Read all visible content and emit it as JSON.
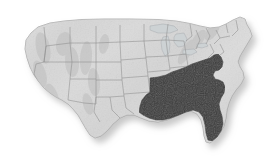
{
  "figure": {
    "kind": "thematic-choropleth-map",
    "caption": "",
    "background_color": "#ffffff",
    "width": 274,
    "height": 168
  },
  "map": {
    "region_name": "Contiguous United States",
    "projection_style": "shaded-relief",
    "shows_state_boundaries": true,
    "shows_drop_shadow": true,
    "base_fill_color": "#dadada",
    "base_shade_light": "#e8e8e8",
    "base_shade_dark": "#bdbdbd",
    "boundary_color": "#8d8d8d",
    "outline_color": "#9a9a9a",
    "highlight_fill_color": "#3a3a3a",
    "highlight_boundary_color": "#2c2c2c",
    "shadow_color": "#cfcfcf"
  },
  "legend": {
    "visible": false,
    "entries": [
      {
        "label": "Highlighted region",
        "color": "#3a3a3a"
      },
      {
        "label": "Other states",
        "color": "#dadada"
      }
    ]
  },
  "highlighted_region": {
    "name": "Southeast",
    "fill_color": "#3a3a3a",
    "states": [
      "Virginia",
      "Kentucky",
      "Tennessee",
      "North Carolina",
      "South Carolina",
      "Georgia",
      "Florida",
      "Alabama",
      "Mississippi",
      "Louisiana",
      "Arkansas"
    ],
    "state_count": 11
  },
  "unhighlighted_regions": {
    "name": "Remainder of the contiguous United States",
    "fill_color": "#dadada",
    "example_states": [
      "Washington",
      "Oregon",
      "California",
      "Idaho",
      "Nevada",
      "Montana",
      "Wyoming",
      "Utah",
      "Arizona",
      "Colorado",
      "New Mexico",
      "North Dakota",
      "South Dakota",
      "Nebraska",
      "Kansas",
      "Oklahoma",
      "Texas",
      "Minnesota",
      "Iowa",
      "Missouri",
      "Wisconsin",
      "Illinois",
      "Michigan",
      "Indiana",
      "Ohio",
      "West Virginia",
      "Maryland",
      "Delaware",
      "Pennsylvania",
      "New Jersey",
      "New York",
      "Connecticut",
      "Rhode Island",
      "Massachusetts",
      "Vermont",
      "New Hampshire",
      "Maine"
    ]
  },
  "labels": {
    "visible_text": [],
    "state_labels_shown": false,
    "title_shown": false
  }
}
